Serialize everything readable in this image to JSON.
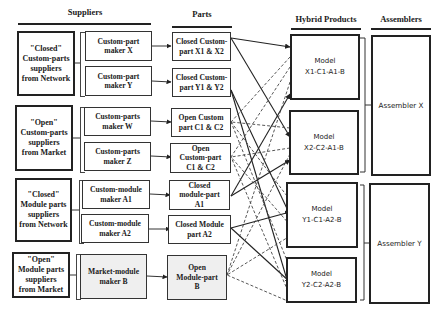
{
  "headers": {
    "suppliers": "Suppliers",
    "parts": "Parts",
    "hybrid_products": "Hybrid Products",
    "assemblers": "Assemblers"
  },
  "supplier_groups": [
    {
      "label": "\"Closed\"\nCustom-parts\nsuppliers\nfrom Network"
    },
    {
      "label": "\"Open\"\nCustom-parts\nsuppliers\nfrom Market"
    },
    {
      "label": "\"Closed\"\nModule parts\nsuppliers\nfrom Network"
    },
    {
      "label": "\"Open\"\nModule parts\nsuppliers\nfrom Market"
    }
  ],
  "makers": [
    {
      "label": "Custom-part\nmaker X"
    },
    {
      "label": "Custom-part\nmaker Y"
    },
    {
      "label": "Custom-parts\nmaker W"
    },
    {
      "label": "Custom-parts\nmaker Z"
    },
    {
      "label": "Custom-module\nmaker A1"
    },
    {
      "label": "Custom-module\nmaker A2"
    },
    {
      "label": "Market-module\nmaker B"
    }
  ],
  "parts": [
    {
      "label": "Closed Custom-\npart X1 & X2"
    },
    {
      "label": "Closed Custom-\npart Y1 & Y2"
    },
    {
      "label": "Open Custom\npart  C1 & C2"
    },
    {
      "label": "Open\nCustom-part\nC1 & C2"
    },
    {
      "label": "Closed\nmodule-part\nA1"
    },
    {
      "label": "Closed  Module\npart A2"
    },
    {
      "label": "Open\nModule-part\nB"
    }
  ],
  "products": [
    {
      "label": "Model\nX1-C1-A1-B"
    },
    {
      "label": "Model\nX2-C2-A1-B"
    },
    {
      "label": "Model\nY1-C1-A2-B"
    },
    {
      "label": "Model\nY2-C2-A2-B"
    }
  ],
  "assemblers": [
    {
      "label": "Assembler X"
    },
    {
      "label": "Assembler Y"
    }
  ],
  "connections": {
    "solid": [
      [
        "Closed Custom-part X1 & X2",
        "Model X1-C1-A1-B"
      ],
      [
        "Closed Custom-part X1 & X2",
        "Model X2-C2-A1-B"
      ],
      [
        "Closed Custom-part Y1 & Y2",
        "Model Y1-C1-A2-B"
      ],
      [
        "Closed Custom-part Y1 & Y2",
        "Model Y2-C2-A2-B"
      ],
      [
        "Closed module-part A1",
        "Model X1-C1-A1-B"
      ],
      [
        "Closed module-part A1",
        "Model X2-C2-A1-B"
      ],
      [
        "Closed Module part A2",
        "Model Y1-C1-A2-B"
      ],
      [
        "Closed Module part A2",
        "Model Y2-C2-A2-B"
      ]
    ],
    "dashed": [
      [
        "Open Custom part C1 & C2",
        "all products"
      ],
      [
        "Open Custom-part C1 & C2",
        "all products"
      ],
      [
        "Open Module-part B",
        "all products"
      ]
    ]
  }
}
